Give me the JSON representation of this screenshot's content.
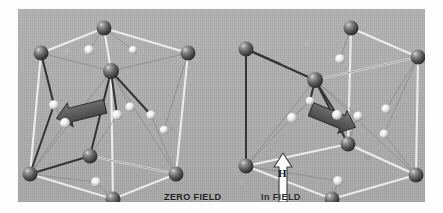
{
  "figure": {
    "panel_background": "#b0b0b0",
    "frame_background": "#ffffff"
  },
  "labels": {
    "zero_field": "ZERO FIELD",
    "in_field": "In FIELD",
    "field_symbol": "H"
  },
  "colors": {
    "dark_atom": "#585858",
    "dark_atom_highlight": "#c8c8c8",
    "light_atom": "#f2f2f2",
    "light_atom_shadow": "#9a9a9a",
    "white_bond": "#f0f0f0",
    "dark_bond": "#3a3a3a",
    "thin_bond": "#8d8d8d",
    "moment_arrow": "#5a5a5a",
    "moment_arrow_edge": "#2e2e2e",
    "field_arrow_fill": "#fbfbfb",
    "field_arrow_edge": "#3a3a3a"
  },
  "cells": [
    {
      "name": "zero-field-cell",
      "caption": "ZERO FIELD",
      "moment_arrow": {
        "direction": "left",
        "angle_deg": -14,
        "x": 60,
        "y": 104,
        "length": 46,
        "width": 16
      },
      "dark_atoms": [
        {
          "cx": 23,
          "cy": 44,
          "r": 7.5
        },
        {
          "cx": 86,
          "cy": 19,
          "r": 7.5
        },
        {
          "cx": 170,
          "cy": 44,
          "r": 7.5
        },
        {
          "cx": 93,
          "cy": 62,
          "r": 8.0
        },
        {
          "cx": 12,
          "cy": 165,
          "r": 7.5
        },
        {
          "cx": 72,
          "cy": 147,
          "r": 7.5
        },
        {
          "cx": 158,
          "cy": 165,
          "r": 7.5
        },
        {
          "cx": 95,
          "cy": 190,
          "r": 7.5
        }
      ],
      "light_atoms": [
        {
          "cx": 71,
          "cy": 41,
          "r": 4.8
        },
        {
          "cx": 115,
          "cy": 41,
          "r": 4.0
        },
        {
          "cx": 36,
          "cy": 96,
          "r": 4.8
        },
        {
          "cx": 47,
          "cy": 114,
          "r": 5.0
        },
        {
          "cx": 99,
          "cy": 106,
          "r": 5.0
        },
        {
          "cx": 112,
          "cy": 98,
          "r": 4.6
        },
        {
          "cx": 133,
          "cy": 106,
          "r": 4.6
        },
        {
          "cx": 146,
          "cy": 121,
          "r": 4.2
        },
        {
          "cx": 78,
          "cy": 173,
          "r": 4.8
        }
      ]
    },
    {
      "name": "in-field-cell",
      "caption": "In FIELD",
      "moment_arrow": {
        "direction": "right-down",
        "angle_deg": 22,
        "x": 317,
        "y": 110,
        "length": 46,
        "width": 16
      },
      "field_arrow": {
        "direction": "up",
        "label": "H",
        "x": 265,
        "y": 148,
        "height": 46,
        "width": 18
      },
      "dark_atoms": [
        {
          "cx": 228,
          "cy": 40,
          "r": 7.5
        },
        {
          "cx": 333,
          "cy": 19,
          "r": 7.5
        },
        {
          "cx": 400,
          "cy": 48,
          "r": 7.5
        },
        {
          "cx": 297,
          "cy": 71,
          "r": 8.0
        },
        {
          "cx": 228,
          "cy": 157,
          "r": 7.5
        },
        {
          "cx": 330,
          "cy": 135,
          "r": 7.5
        },
        {
          "cx": 398,
          "cy": 166,
          "r": 7.5
        },
        {
          "cx": 314,
          "cy": 190,
          "r": 7.5
        }
      ],
      "light_atoms": [
        {
          "cx": 322,
          "cy": 50,
          "r": 4.8
        },
        {
          "cx": 292,
          "cy": 92,
          "r": 4.2
        },
        {
          "cx": 274,
          "cy": 109,
          "r": 5.0
        },
        {
          "cx": 319,
          "cy": 106,
          "r": 5.0
        },
        {
          "cx": 340,
          "cy": 107,
          "r": 4.6
        },
        {
          "cx": 368,
          "cy": 100,
          "r": 4.6
        },
        {
          "cx": 366,
          "cy": 125,
          "r": 4.4
        },
        {
          "cx": 320,
          "cy": 172,
          "r": 4.8
        }
      ]
    }
  ]
}
